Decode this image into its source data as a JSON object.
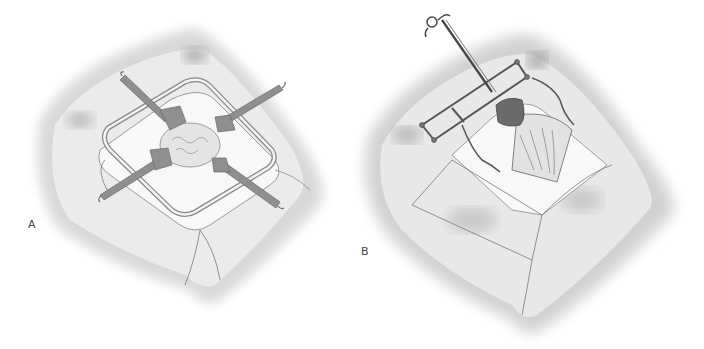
{
  "figure": {
    "panels": [
      {
        "label": "A",
        "description": "Surgical field with square ring retractor frame and four blade retractors exposing tissue"
      },
      {
        "label": "B",
        "description": "Surgical field with rectangular retractor frame, clamp instrument, and exposed tissue in triangular incision"
      }
    ]
  },
  "colors": {
    "background": "#ffffff",
    "skin_light": "#ececec",
    "skin_shadow": "#bdbdbd",
    "instrument": "#8a8a8a",
    "instrument_dark": "#4a4a4a",
    "drape": "#f7f7f7",
    "label_text": "#444444"
  }
}
